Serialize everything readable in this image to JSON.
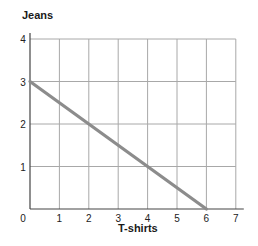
{
  "chart_data": {
    "type": "line",
    "title": "",
    "xlabel": "T-shirts",
    "ylabel": "Jeans",
    "x_ticks": [
      0,
      1,
      2,
      3,
      4,
      5,
      6,
      7
    ],
    "y_ticks": [
      0,
      1,
      2,
      3,
      4
    ],
    "xlim": [
      0,
      7
    ],
    "ylim": [
      0,
      4
    ],
    "grid": true,
    "series": [
      {
        "name": "Budget line",
        "x": [
          0,
          2,
          4,
          6
        ],
        "y": [
          3,
          2,
          1,
          0
        ],
        "color": "#8c8c8c"
      }
    ]
  },
  "labels": {
    "y_axis": "Jeans",
    "x_axis": "T-shirts"
  }
}
